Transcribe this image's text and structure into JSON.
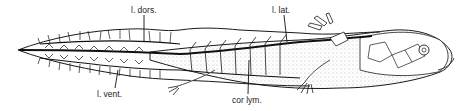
{
  "figure": {
    "labels": [
      {
        "id": "l-dors",
        "text": "l. dors.",
        "x": 131,
        "y": 6
      },
      {
        "id": "l-lat",
        "text": "l. lat.",
        "x": 272,
        "y": 6
      },
      {
        "id": "l-vent",
        "text": "l. vent.",
        "x": 97,
        "y": 90
      },
      {
        "id": "cor-lym",
        "text": "cor lym.",
        "x": 232,
        "y": 96
      }
    ],
    "colors": {
      "ink": "#1a1a1a",
      "background": "#ffffff",
      "stipple": "#777777"
    }
  }
}
